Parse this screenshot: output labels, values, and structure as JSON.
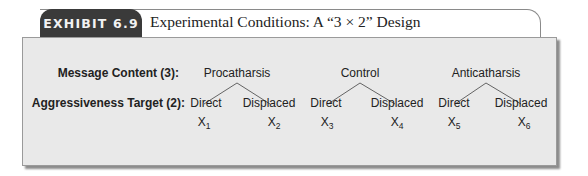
{
  "exhibit": {
    "tab_label": "EXHIBIT 6.9",
    "title": "Experimental Conditions: A “3 × 2” Design",
    "tab_color": "#3a3a3a",
    "panel_color": "#e9e9e9"
  },
  "diagram": {
    "row_labels": {
      "factor1": "Message Content (3):",
      "factor2": "Aggressiveness Target (2):"
    },
    "groups": [
      {
        "label": "Procatharsis",
        "children": [
          {
            "label": "Direct",
            "cell": "X",
            "sub": "1"
          },
          {
            "label": "Displaced",
            "cell": "X",
            "sub": "2"
          }
        ]
      },
      {
        "label": "Control",
        "children": [
          {
            "label": "Direct",
            "cell": "X",
            "sub": "3"
          },
          {
            "label": "Displaced",
            "cell": "X",
            "sub": "4"
          }
        ]
      },
      {
        "label": "Anticatharsis",
        "children": [
          {
            "label": "Direct",
            "cell": "X",
            "sub": "5"
          },
          {
            "label": "Displaced",
            "cell": "X",
            "sub": "6"
          }
        ]
      }
    ]
  }
}
